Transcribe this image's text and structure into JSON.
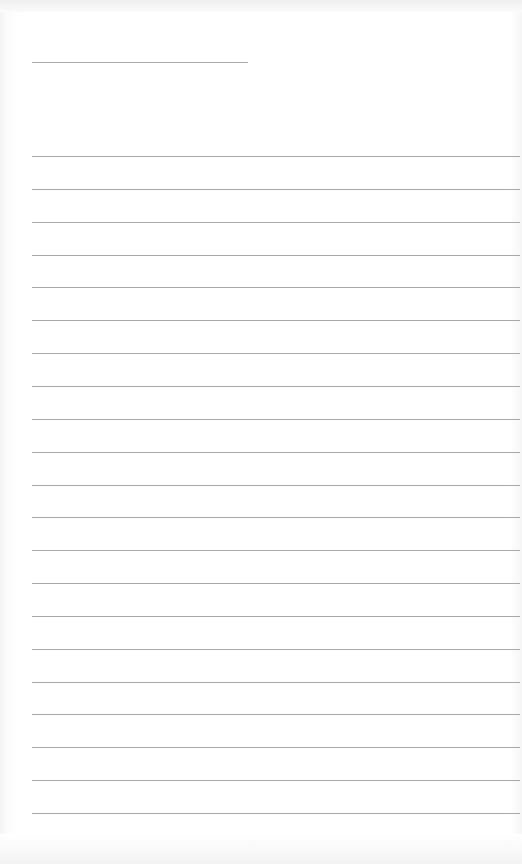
{
  "document": {
    "type": "lined-paper",
    "header_line": {
      "x": 32,
      "y": 62,
      "width": 216
    },
    "rules": {
      "count": 21,
      "x": 32,
      "width": 488,
      "first_y": 156,
      "spacing": 32.85
    },
    "text": []
  },
  "colors": {
    "paper": "#ffffff",
    "rule": "#9a9a9a"
  }
}
